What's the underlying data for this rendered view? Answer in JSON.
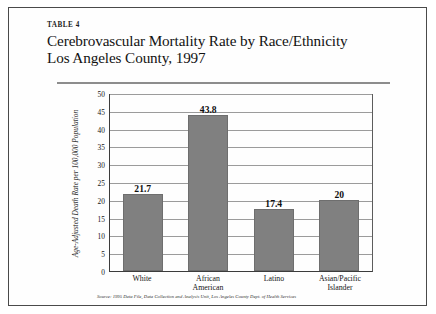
{
  "document": {
    "table_label": "TABLE 4",
    "title_line_1": "Cerebrovascular Mortality Rate by Race/Ethnicity",
    "title_line_2": "Los Angeles County, 1997",
    "source_note": "Source: 1995 Data File, Data Collection and Analysis Unit, Los Angeles County Dept. of Health Services"
  },
  "chart_data": {
    "type": "bar",
    "title": "Cerebrovascular Mortality Rate by Race/Ethnicity Los Angeles County, 1997",
    "subtitle": "",
    "xlabel": "",
    "ylabel": "Age-Adjusted Death Rate per 100,000 Population",
    "categories": [
      "White",
      "African American",
      "Latino",
      "Asian/Pacific Islander"
    ],
    "category_lines": [
      [
        "White"
      ],
      [
        "African",
        "American"
      ],
      [
        "Latino"
      ],
      [
        "Asian/Pacific",
        "Islander"
      ]
    ],
    "values": [
      21.7,
      43.8,
      17.4,
      20
    ],
    "data_labels": [
      "21.7",
      "43.8",
      "17.4",
      "20"
    ],
    "ylim": [
      0,
      50
    ],
    "yticks": [
      50,
      45,
      40,
      35,
      30,
      25,
      20,
      15,
      10,
      5,
      0
    ],
    "ytick_labels": [
      "50",
      "45",
      "40",
      "35",
      "30",
      "25",
      "20",
      "15",
      "10",
      "5",
      "0"
    ],
    "grid": true,
    "grid_orientation": "horizontal",
    "legend": false,
    "legend_position": "none",
    "bar_color": "#808080",
    "gridline_color": "#9b9b9b",
    "axis_color": "#3c3c3c",
    "rule_color": "#8d8d8d",
    "frame_color": "#4a4a4a"
  }
}
